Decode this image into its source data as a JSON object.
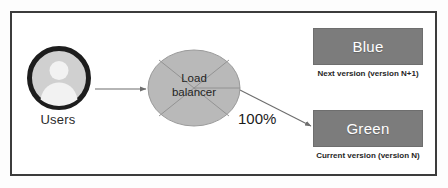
{
  "diagram": {
    "frame": {
      "border_color": "#3c3c3c"
    },
    "nodes": {
      "users": {
        "label": "Users",
        "icon": "user-avatar-icon",
        "ring_color": "#1f1f1f",
        "fill_color": "#c9c9c9"
      },
      "load_balancer": {
        "label_line1": "Load",
        "label_line2": "balancer",
        "shape": "ellipse",
        "fill_color": "#b9b9b9",
        "stroke_color": "#8f8f8f"
      },
      "blue": {
        "label": "Blue",
        "caption": "Next version (version N+1)",
        "fill_color": "#7c7c7c",
        "text_color": "#ffffff"
      },
      "green": {
        "label": "Green",
        "caption": "Current version (version N)",
        "fill_color": "#7c7c7c",
        "text_color": "#ffffff"
      }
    },
    "edges": {
      "users_to_lb": {
        "label": "",
        "style": "solid-arrow"
      },
      "lb_to_green": {
        "label": "100%",
        "style": "solid-arrow"
      },
      "lb_to_blue": {
        "label": "",
        "style": "none"
      }
    }
  }
}
